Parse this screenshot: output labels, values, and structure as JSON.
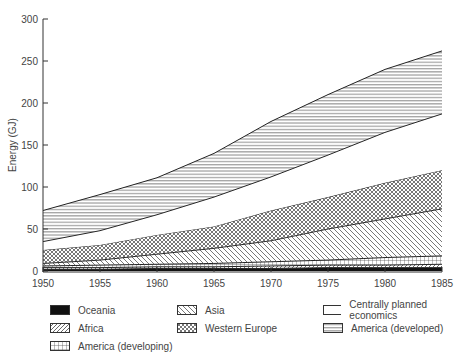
{
  "chart_data": {
    "type": "area",
    "stacked": true,
    "title": "",
    "xlabel": "",
    "ylabel": "Energy (GJ)",
    "xlim": [
      1950,
      1985
    ],
    "ylim": [
      0,
      300
    ],
    "x": [
      1950,
      1955,
      1960,
      1965,
      1970,
      1975,
      1980,
      1985
    ],
    "x_ticks": [
      "1950",
      "1955",
      "1960",
      "1965",
      "1970",
      "1975",
      "1980",
      "1985"
    ],
    "y_ticks": [
      "0",
      "50",
      "100",
      "150",
      "200",
      "250",
      "300"
    ],
    "grid": false,
    "legend_position": "bottom",
    "cumulative_tops": {
      "Oceania": [
        2,
        2,
        3,
        3,
        3,
        4,
        4,
        4
      ],
      "Africa": [
        4,
        4,
        5,
        5,
        6,
        7,
        7,
        8
      ],
      "America (developing)": [
        6,
        7,
        8,
        9,
        11,
        13,
        16,
        18
      ],
      "Asia": [
        9,
        13,
        20,
        27,
        36,
        50,
        62,
        74
      ],
      "Western Europe": [
        25,
        31,
        43,
        53,
        72,
        88,
        105,
        120
      ],
      "Centrally planned economics": [
        35,
        48,
        67,
        88,
        112,
        138,
        165,
        187
      ],
      "America (developed)": [
        72,
        91,
        111,
        140,
        178,
        210,
        240,
        262
      ]
    },
    "series": [
      {
        "name": "Oceania",
        "pattern": "solid-black",
        "values": [
          2,
          2,
          3,
          3,
          3,
          4,
          4,
          4
        ]
      },
      {
        "name": "Africa",
        "pattern": "forward-diagonal",
        "values": [
          2,
          2,
          2,
          2,
          3,
          3,
          3,
          4
        ]
      },
      {
        "name": "America (developing)",
        "pattern": "grid",
        "values": [
          2,
          3,
          3,
          4,
          5,
          6,
          9,
          10
        ]
      },
      {
        "name": "Asia",
        "pattern": "back-diagonal",
        "values": [
          3,
          6,
          12,
          18,
          25,
          37,
          46,
          56
        ]
      },
      {
        "name": "Western Europe",
        "pattern": "crosshatch",
        "values": [
          16,
          18,
          23,
          26,
          36,
          38,
          43,
          46
        ]
      },
      {
        "name": "Centrally planned economics",
        "pattern": "blank",
        "values": [
          10,
          17,
          24,
          35,
          40,
          50,
          60,
          67
        ]
      },
      {
        "name": "America (developed)",
        "pattern": "horizontal",
        "values": [
          37,
          43,
          44,
          52,
          66,
          72,
          75,
          75
        ]
      }
    ]
  },
  "legend": {
    "items": [
      {
        "label": "Oceania",
        "pattern": "solid-black"
      },
      {
        "label": "Asia",
        "pattern": "back-diagonal"
      },
      {
        "label": "Centrally planned economics",
        "pattern": "blank"
      },
      {
        "label": "Africa",
        "pattern": "forward-diagonal"
      },
      {
        "label": "Western Europe",
        "pattern": "crosshatch"
      },
      {
        "label": "America (developed)",
        "pattern": "horizontal"
      },
      {
        "label": "America (developing)",
        "pattern": "grid"
      }
    ]
  }
}
